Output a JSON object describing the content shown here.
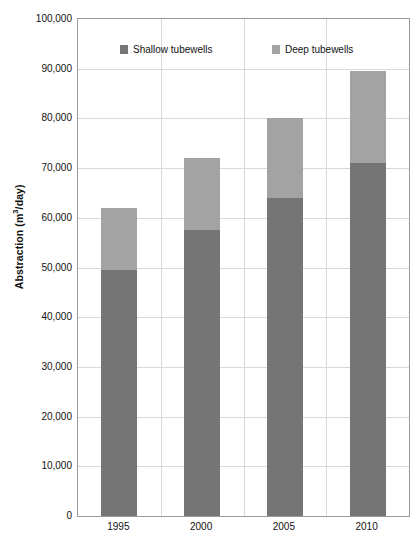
{
  "chart_data": {
    "type": "bar",
    "subtype": "stacked-column",
    "title": "",
    "xlabel": "",
    "ylabel": "Abstraction (m³/day)",
    "categories": [
      "1995",
      "2000",
      "2005",
      "2010"
    ],
    "series": [
      {
        "name": "Shallow tubewells",
        "color": "#757575",
        "values": [
          49500,
          57500,
          64000,
          71000
        ]
      },
      {
        "name": "Deep tubewells",
        "color": "#a3a3a3",
        "values": [
          12500,
          14500,
          16000,
          18500
        ]
      }
    ],
    "totals": [
      62000,
      72000,
      80000,
      89500
    ],
    "ylim": [
      0,
      100000
    ],
    "yticks": [
      0,
      10000,
      20000,
      30000,
      40000,
      50000,
      60000,
      70000,
      80000,
      90000,
      100000
    ],
    "ytick_labels": [
      "0",
      "10,000",
      "20,000",
      "30,000",
      "40,000",
      "50,000",
      "60,000",
      "70,000",
      "80,000",
      "90,000",
      "100,000"
    ],
    "grid": {
      "horizontal": true,
      "vertical": true
    },
    "legend": {
      "position": "inside-top",
      "entries": [
        {
          "label": "Shallow tubewells",
          "color": "#757575"
        },
        {
          "label": "Deep tubewells",
          "color": "#a3a3a3"
        }
      ]
    }
  },
  "axis": {
    "y_title_main": "Abstraction (m",
    "y_title_sup": "3",
    "y_title_tail": "/day)"
  }
}
